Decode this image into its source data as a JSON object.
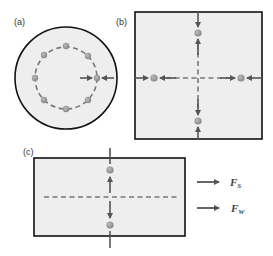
{
  "panels": {
    "a": {
      "label": "(a)",
      "shape": "circle",
      "dots": 8
    },
    "b": {
      "label": "(b)",
      "shape": "square",
      "dots": 4
    },
    "c": {
      "label": "(c)",
      "shape": "rectangle",
      "dots": 2
    }
  },
  "legend": [
    {
      "symbol": "F",
      "subscript": "S",
      "icon": "arrow-right-icon"
    },
    {
      "symbol": "F",
      "subscript": "W",
      "icon": "arrow-right-icon"
    }
  ],
  "colors": {
    "fill": "#eeeeee",
    "outline": "#111111",
    "dash": "#777777",
    "dot": "#999999",
    "arrow": "#555555"
  }
}
